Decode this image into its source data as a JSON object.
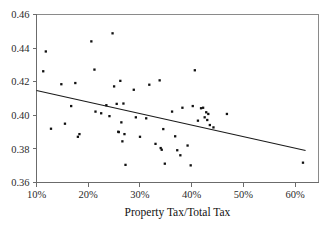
{
  "chart_data": {
    "type": "scatter",
    "title": "",
    "xlabel": "Property Tax/Total Tax",
    "ylabel": "",
    "xlim": [
      0.1,
      0.645
    ],
    "ylim": [
      0.36,
      0.46
    ],
    "grid": false,
    "legend": null,
    "xticks": [
      {
        "value": 0.1,
        "label": "10%"
      },
      {
        "value": 0.2,
        "label": "20%"
      },
      {
        "value": 0.3,
        "label": "30%"
      },
      {
        "value": 0.4,
        "label": "40%"
      },
      {
        "value": 0.5,
        "label": "50%"
      },
      {
        "value": 0.6,
        "label": "60%"
      }
    ],
    "yticks": [
      {
        "value": 0.36,
        "label": "0.36"
      },
      {
        "value": 0.38,
        "label": "0.38"
      },
      {
        "value": 0.4,
        "label": "0.40"
      },
      {
        "value": 0.42,
        "label": "0.42"
      },
      {
        "value": 0.44,
        "label": "0.44"
      },
      {
        "value": 0.46,
        "label": "0.46"
      }
    ],
    "marker": {
      "shape": "square",
      "size": 2.3,
      "color": "#111111"
    },
    "points": [
      {
        "x": 0.118,
        "y": 0.438
      },
      {
        "x": 0.113,
        "y": 0.4262
      },
      {
        "x": 0.128,
        "y": 0.392
      },
      {
        "x": 0.148,
        "y": 0.4185
      },
      {
        "x": 0.155,
        "y": 0.395
      },
      {
        "x": 0.167,
        "y": 0.4055
      },
      {
        "x": 0.175,
        "y": 0.4192
      },
      {
        "x": 0.18,
        "y": 0.3872
      },
      {
        "x": 0.183,
        "y": 0.3888
      },
      {
        "x": 0.206,
        "y": 0.444
      },
      {
        "x": 0.212,
        "y": 0.4272
      },
      {
        "x": 0.214,
        "y": 0.4022
      },
      {
        "x": 0.225,
        "y": 0.4012
      },
      {
        "x": 0.235,
        "y": 0.406
      },
      {
        "x": 0.241,
        "y": 0.3995
      },
      {
        "x": 0.247,
        "y": 0.4488
      },
      {
        "x": 0.25,
        "y": 0.4172
      },
      {
        "x": 0.255,
        "y": 0.4068
      },
      {
        "x": 0.258,
        "y": 0.3902
      },
      {
        "x": 0.259,
        "y": 0.39
      },
      {
        "x": 0.262,
        "y": 0.4205
      },
      {
        "x": 0.264,
        "y": 0.3958
      },
      {
        "x": 0.266,
        "y": 0.3845
      },
      {
        "x": 0.268,
        "y": 0.407
      },
      {
        "x": 0.27,
        "y": 0.3888
      },
      {
        "x": 0.272,
        "y": 0.3705
      },
      {
        "x": 0.288,
        "y": 0.4152
      },
      {
        "x": 0.292,
        "y": 0.3988
      },
      {
        "x": 0.3,
        "y": 0.3872
      },
      {
        "x": 0.312,
        "y": 0.3982
      },
      {
        "x": 0.318,
        "y": 0.4182
      },
      {
        "x": 0.33,
        "y": 0.383
      },
      {
        "x": 0.338,
        "y": 0.4208
      },
      {
        "x": 0.34,
        "y": 0.3805
      },
      {
        "x": 0.342,
        "y": 0.3795
      },
      {
        "x": 0.345,
        "y": 0.3918
      },
      {
        "x": 0.348,
        "y": 0.3712
      },
      {
        "x": 0.362,
        "y": 0.4022
      },
      {
        "x": 0.368,
        "y": 0.3875
      },
      {
        "x": 0.372,
        "y": 0.3792
      },
      {
        "x": 0.378,
        "y": 0.3762
      },
      {
        "x": 0.382,
        "y": 0.4045
      },
      {
        "x": 0.392,
        "y": 0.382
      },
      {
        "x": 0.398,
        "y": 0.3702
      },
      {
        "x": 0.402,
        "y": 0.4055
      },
      {
        "x": 0.406,
        "y": 0.4268
      },
      {
        "x": 0.412,
        "y": 0.3968
      },
      {
        "x": 0.418,
        "y": 0.4042
      },
      {
        "x": 0.422,
        "y": 0.4045
      },
      {
        "x": 0.425,
        "y": 0.3988
      },
      {
        "x": 0.428,
        "y": 0.4018
      },
      {
        "x": 0.43,
        "y": 0.3972
      },
      {
        "x": 0.432,
        "y": 0.4008
      },
      {
        "x": 0.435,
        "y": 0.3942
      },
      {
        "x": 0.442,
        "y": 0.3928
      },
      {
        "x": 0.468,
        "y": 0.4008
      },
      {
        "x": 0.615,
        "y": 0.3718
      }
    ],
    "regression": {
      "label": "fitted line",
      "x_start": 0.1,
      "y_start": 0.4148,
      "x_end": 0.62,
      "y_end": 0.379
    }
  }
}
